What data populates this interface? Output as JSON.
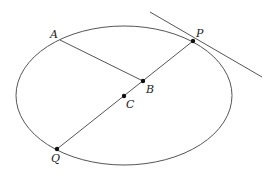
{
  "diagram": {
    "type": "geometry",
    "stroke_color": "#555555",
    "point_color": "#111111",
    "ellipse": {
      "cx": 124,
      "cy": 95.5,
      "rx": 108,
      "ry": 69.5
    },
    "points": [
      {
        "id": "A",
        "label": "A",
        "x": 60,
        "y": 40,
        "label_x": 50,
        "label_y": 38,
        "dot": false
      },
      {
        "id": "P",
        "label": "P",
        "x": 193,
        "y": 41,
        "label_x": 196,
        "label_y": 37,
        "dot": true
      },
      {
        "id": "B",
        "label": "B",
        "x": 143,
        "y": 81,
        "label_x": 146,
        "label_y": 93,
        "dot": true
      },
      {
        "id": "C",
        "label": "C",
        "x": 124,
        "y": 96,
        "label_x": 126,
        "label_y": 108,
        "dot": true
      },
      {
        "id": "Q",
        "label": "Q",
        "x": 57,
        "y": 149,
        "label_x": 51,
        "label_y": 162,
        "dot": true
      }
    ],
    "segments": [
      {
        "id": "PQ",
        "from": "P",
        "to": "Q"
      },
      {
        "id": "AB",
        "from": "A",
        "to": "B"
      }
    ],
    "tangent": {
      "x1": 150,
      "y1": 12,
      "x2": 262,
      "y2": 77
    }
  }
}
